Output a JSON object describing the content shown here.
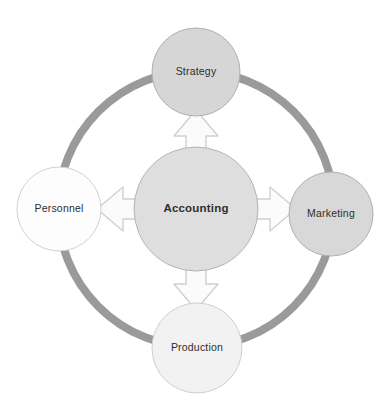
{
  "diagram": {
    "background_color": "#ffffff",
    "ring": {
      "name": "connecting-ring",
      "color": "#9a9a9a",
      "center_x": 196,
      "center_y": 209,
      "radius": 138,
      "thickness": 8
    },
    "center_node": {
      "label": "Accounting",
      "fill": "#dedede",
      "stroke": "#b4b4b4",
      "cx": 196,
      "cy": 209,
      "r": 62,
      "bold": true
    },
    "nodes": [
      {
        "id": "strategy",
        "label": "Strategy",
        "position": "top",
        "fill": "#d6d6d6",
        "stroke": "#b0b0b0",
        "cx": 196,
        "cy": 72,
        "r": 44
      },
      {
        "id": "marketing",
        "label": "Marketing",
        "position": "right",
        "fill": "#d8d8d8",
        "stroke": "#b0b0b0",
        "cx": 331,
        "cy": 214,
        "r": 42
      },
      {
        "id": "production",
        "label": "Production",
        "position": "bottom",
        "fill": "#f2f2f2",
        "stroke": "#cfcfcf",
        "cx": 197,
        "cy": 348,
        "r": 45
      },
      {
        "id": "personnel",
        "label": "Personnel",
        "position": "left",
        "fill": "#fdfdfd",
        "stroke": "#d2d2d2",
        "cx": 59,
        "cy": 209,
        "r": 42
      }
    ],
    "arrows": [
      {
        "id": "arrow-up",
        "direction": "up",
        "from": "accounting",
        "to": "strategy",
        "fill": "#fbfbfb",
        "stroke": "#d0d0d0"
      },
      {
        "id": "arrow-right",
        "direction": "right",
        "from": "accounting",
        "to": "marketing",
        "fill": "#fbfbfb",
        "stroke": "#d0d0d0"
      },
      {
        "id": "arrow-down",
        "direction": "down",
        "from": "accounting",
        "to": "production",
        "fill": "#fbfbfb",
        "stroke": "#d0d0d0"
      },
      {
        "id": "arrow-left",
        "direction": "left",
        "from": "accounting",
        "to": "personnel",
        "fill": "#fbfbfb",
        "stroke": "#d0d0d0"
      }
    ]
  }
}
